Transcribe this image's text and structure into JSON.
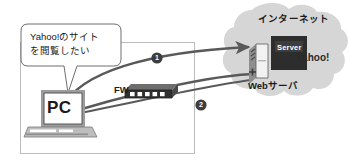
{
  "diagram": {
    "colors": {
      "cloud_fill": "#d4d4d4",
      "arrow_stroke": "#595959",
      "device_dark": "#3a3a3a",
      "device_gray": "#9a9a9a",
      "lan_border": "#b9b9b9",
      "bubble_border": "#707070",
      "text": "#1a1a1a"
    },
    "speech_bubble": {
      "line1": "Yahoo!のサイト",
      "line2": "を閲覧したい",
      "full_text": "Yahoo!のサイトを閲覧したい"
    },
    "cloud": {
      "label": "インターネット"
    },
    "nodes": [
      {
        "id": "pc",
        "label": "PC",
        "icon": "laptop-icon"
      },
      {
        "id": "firewall",
        "label": "FW",
        "icon": "firewall-appliance-icon",
        "port_count": 5
      },
      {
        "id": "webserver",
        "label": "Webサーバ",
        "icon": "server-tower-icon"
      },
      {
        "id": "yahoo",
        "label": "Yahoo!",
        "badge_label": "Server",
        "icon": "server-badge-icon"
      }
    ],
    "flows": [
      {
        "number": "1",
        "marker": "❶",
        "direction": "pc-to-webserver"
      },
      {
        "number": "2",
        "marker": "❷",
        "direction": "webserver-to-pc"
      }
    ],
    "lan_boundary": {
      "name": "internal-network-boundary"
    }
  }
}
